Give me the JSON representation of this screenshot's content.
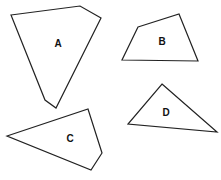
{
  "diagram": {
    "background": "#ffffff",
    "stroke_color": "#222222",
    "shapes": [
      {
        "label": "A",
        "type": "pentagon",
        "points": "11,15 80,6 101,18 56,108 45,100",
        "label_pos": [
          58,
          43
        ]
      },
      {
        "label": "B",
        "type": "quadrilateral",
        "points": "138,27 179,14 198,61 122,60",
        "label_pos": [
          162,
          41
        ]
      },
      {
        "label": "C",
        "type": "quadrilateral",
        "points": "7,136 88,109 102,153 91,170",
        "label_pos": [
          70,
          138
        ]
      },
      {
        "label": "D",
        "type": "triangle",
        "points": "162,84 217,132 128,124",
        "label_pos": [
          166,
          112
        ]
      }
    ]
  }
}
